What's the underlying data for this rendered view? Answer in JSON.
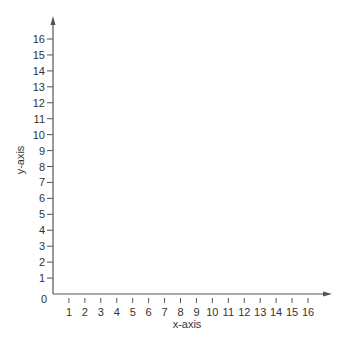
{
  "chart_data": {
    "type": "scatter",
    "title": "",
    "xlabel": "x-axis",
    "ylabel": "y-axis",
    "xlim": [
      0,
      16
    ],
    "ylim": [
      0,
      16
    ],
    "x_ticks": [
      1,
      2,
      3,
      4,
      5,
      6,
      7,
      8,
      9,
      10,
      11,
      12,
      13,
      14,
      15,
      16
    ],
    "y_ticks": [
      1,
      2,
      3,
      4,
      5,
      6,
      7,
      8,
      9,
      10,
      11,
      12,
      13,
      14,
      15,
      16
    ],
    "origin_label": "0",
    "grid": false,
    "series": [],
    "axis_arrows": true,
    "colors": {
      "axis": "#555555",
      "text": "#333333",
      "background": "#ffffff"
    }
  }
}
